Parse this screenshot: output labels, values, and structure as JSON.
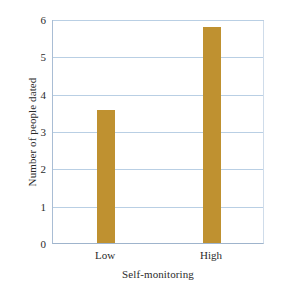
{
  "chart_data": {
    "type": "bar",
    "title": "",
    "subtitle": "",
    "categories": [
      "Low",
      "High"
    ],
    "values": [
      3.55,
      5.78
    ],
    "series": [
      {
        "name": "Number of people dated",
        "values": [
          3.55,
          5.78
        ]
      }
    ],
    "xlabel": "Self-monitoring",
    "ylabel": "Number of people dated",
    "ylim": [
      0,
      6
    ],
    "ytick_labels": [
      "0",
      "1",
      "2",
      "3",
      "4",
      "5",
      "6"
    ],
    "ytick_values": [
      0,
      1,
      2,
      3,
      4,
      5,
      6
    ],
    "xtick_labels": [
      "Low",
      "High"
    ],
    "grid": true,
    "grid_axis": "y",
    "legend": false,
    "legend_position": "none",
    "bar_color": "#bf9130",
    "gridline_color": "#b9cfe4",
    "axis_color": "#a9bdd4",
    "text_color": "#2b2b2b",
    "background_color": "#ffffff"
  }
}
